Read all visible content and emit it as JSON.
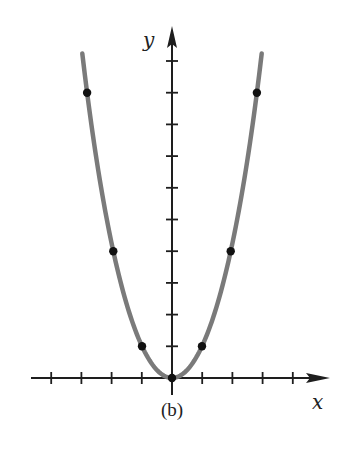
{
  "figure": {
    "caption": "(b)",
    "x_axis_label": "x",
    "y_axis_label": "y"
  },
  "colors": {
    "axis": "#1e1e1e",
    "curve": "#7a7a7a",
    "point": "#111111",
    "background": "#ffffff"
  },
  "chart_data": {
    "type": "line",
    "title": "",
    "caption": "(b)",
    "function": "y = x^2",
    "xlabel": "x",
    "ylabel": "y",
    "xlim": [
      -4.5,
      5
    ],
    "ylim": [
      -0.5,
      10.5
    ],
    "x_ticks": [
      -4,
      -3,
      -2,
      -1,
      1,
      2,
      3,
      4
    ],
    "y_ticks": [
      1,
      2,
      3,
      4,
      5,
      6,
      7,
      8,
      9,
      10
    ],
    "tick_labels_shown": false,
    "grid": false,
    "legend": null,
    "series": [
      {
        "name": "parabola",
        "kind": "curve",
        "x_range": [
          -3.2,
          3.2
        ],
        "points": [
          {
            "x": -3,
            "y": 9
          },
          {
            "x": -2,
            "y": 4
          },
          {
            "x": -1,
            "y": 1
          },
          {
            "x": 0,
            "y": 0
          },
          {
            "x": 1,
            "y": 1
          },
          {
            "x": 2,
            "y": 4
          },
          {
            "x": 3,
            "y": 9
          }
        ]
      }
    ]
  }
}
